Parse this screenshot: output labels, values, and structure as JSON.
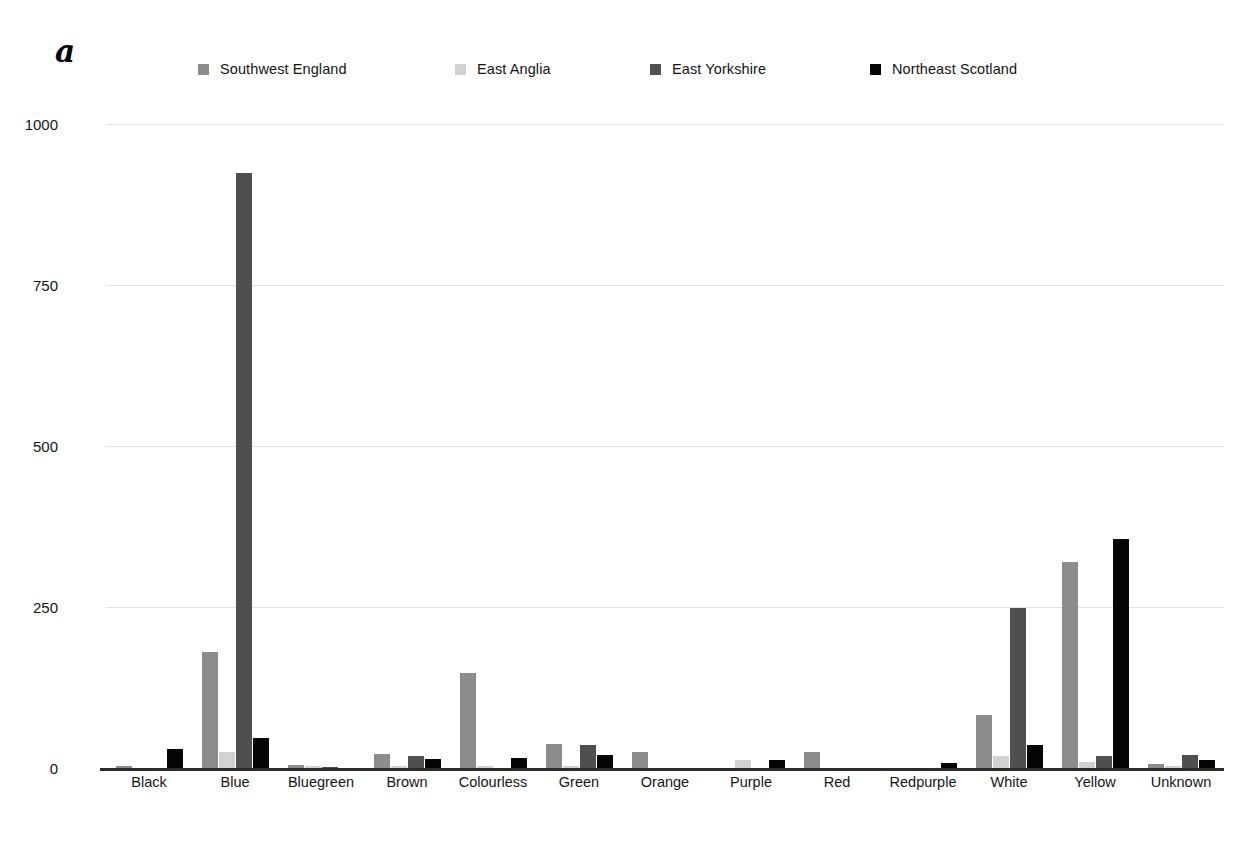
{
  "panel": {
    "letter": "a"
  },
  "chart_data": {
    "type": "bar",
    "title": "",
    "xlabel": "",
    "ylabel": "",
    "ylim": [
      0,
      1000
    ],
    "yticks": [
      0,
      250,
      500,
      750,
      1000
    ],
    "ytick_labels": [
      "0",
      "250",
      "500",
      "750",
      "1000"
    ],
    "grid": true,
    "legend_position": "top",
    "categories": [
      "Black",
      "Blue",
      "Bluegreen",
      "Brown",
      "Colourless",
      "Green",
      "Orange",
      "Purple",
      "Red",
      "Redpurple",
      "White",
      "Yellow",
      "Unknown"
    ],
    "series": [
      {
        "name": "Southwest England",
        "color": "#8c8c8c",
        "values": [
          3,
          180,
          4,
          22,
          148,
          37,
          25,
          0,
          25,
          0,
          82,
          320,
          7
        ]
      },
      {
        "name": "East Anglia",
        "color": "#d2d2d2",
        "values": [
          0,
          25,
          3,
          3,
          3,
          3,
          0,
          13,
          0,
          0,
          18,
          10,
          3
        ]
      },
      {
        "name": "East Yorkshire",
        "color": "#4f4f4f",
        "values": [
          0,
          924,
          2,
          18,
          0,
          35,
          0,
          0,
          0,
          0,
          248,
          18,
          20
        ]
      },
      {
        "name": "Northeast Scotland",
        "color": "#050505",
        "values": [
          30,
          47,
          0,
          14,
          15,
          20,
          0,
          12,
          0,
          8,
          35,
          355,
          12
        ]
      }
    ]
  }
}
